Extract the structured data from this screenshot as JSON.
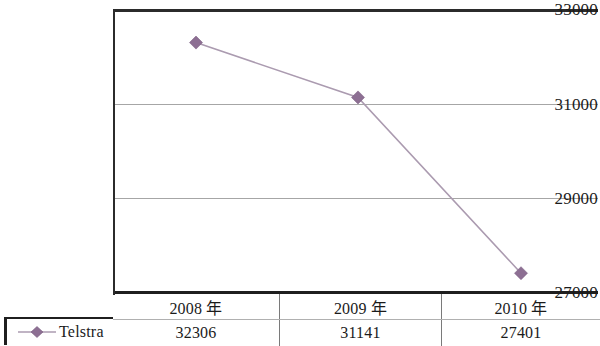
{
  "chart_data": {
    "type": "line",
    "title": "",
    "xlabel": "",
    "ylabel": "",
    "categories": [
      "2008 年",
      "2009 年",
      "2010 年"
    ],
    "series": [
      {
        "name": "Telstra",
        "values": [
          32306,
          31141,
          27401
        ],
        "color": "#8d6f93",
        "marker": "diamond"
      }
    ],
    "ylim": [
      27000,
      33000
    ],
    "yticks": [
      33000,
      31000,
      29000,
      27000
    ],
    "ytick_labels": [
      "33000",
      "31000",
      "29000",
      "27000"
    ],
    "grid": true,
    "legend_position": "bottom-left",
    "has_data_table": true
  },
  "axis": {
    "ticks": [
      {
        "label": "33000",
        "value": 33000
      },
      {
        "label": "31000",
        "value": 31000
      },
      {
        "label": "29000",
        "value": 29000
      },
      {
        "label": "27000",
        "value": 27000
      }
    ]
  },
  "legend": {
    "entries": [
      {
        "label": "Telstra",
        "color": "#8d6f93",
        "marker_icon": "diamond-marker-icon"
      }
    ]
  },
  "table": {
    "headers": [
      "2008 年",
      "2009 年",
      "2010 年"
    ],
    "rows": [
      {
        "label": "Telstra",
        "values": [
          "32306",
          "31141",
          "27401"
        ]
      }
    ]
  },
  "colors": {
    "series": "#8d6f93",
    "line": "#ab9bb0",
    "gridline": "#a6a6a6",
    "axis": "#2b2b2b",
    "text": "#1b1b1b"
  }
}
